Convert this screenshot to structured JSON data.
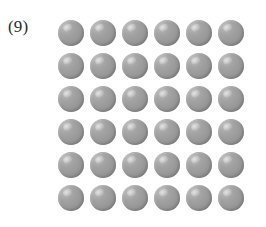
{
  "figure": {
    "label": "(9)",
    "background_color": "#ffffff",
    "label_color": "#2b2b2b"
  },
  "grid": {
    "rows": 6,
    "columns": 6,
    "total_spheres": 36,
    "sphere_name": "gray-sphere",
    "sphere_diameter_px": 26,
    "column_pitch_px": 32,
    "row_pitch_px": 33,
    "colors": {
      "sphere_base": "#9b9b9b",
      "sphere_highlight": "#c2c2c2",
      "sphere_shadow": "#858585"
    },
    "cells": [
      [
        {
          "index": 1
        },
        {
          "index": 2
        },
        {
          "index": 3
        },
        {
          "index": 4
        },
        {
          "index": 5
        },
        {
          "index": 6
        }
      ],
      [
        {
          "index": 7
        },
        {
          "index": 8
        },
        {
          "index": 9
        },
        {
          "index": 10
        },
        {
          "index": 11
        },
        {
          "index": 12
        }
      ],
      [
        {
          "index": 13
        },
        {
          "index": 14
        },
        {
          "index": 15
        },
        {
          "index": 16
        },
        {
          "index": 17
        },
        {
          "index": 18
        }
      ],
      [
        {
          "index": 19
        },
        {
          "index": 20
        },
        {
          "index": 21
        },
        {
          "index": 22
        },
        {
          "index": 23
        },
        {
          "index": 24
        }
      ],
      [
        {
          "index": 25
        },
        {
          "index": 26
        },
        {
          "index": 27
        },
        {
          "index": 28
        },
        {
          "index": 29
        },
        {
          "index": 30
        }
      ],
      [
        {
          "index": 31
        },
        {
          "index": 32
        },
        {
          "index": 33
        },
        {
          "index": 34
        },
        {
          "index": 35
        },
        {
          "index": 36
        }
      ]
    ]
  }
}
